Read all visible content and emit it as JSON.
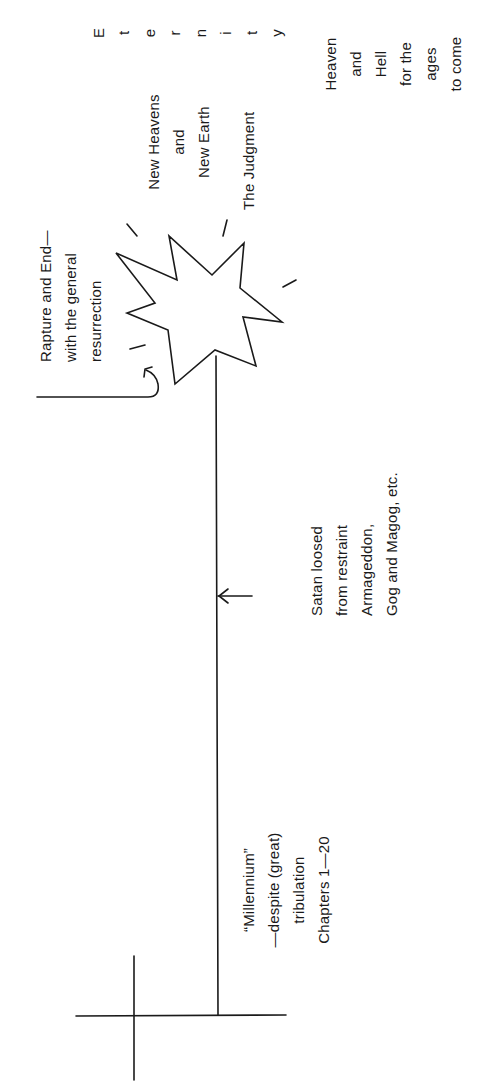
{
  "figure": {
    "orientation": "rotated -90 degrees",
    "stroke_color": "#1a1a1a",
    "background": "#ffffff"
  },
  "labels": {
    "rapture": [
      "Rapture and End—",
      "with the general",
      "resurrection"
    ],
    "new_heavens": [
      "New Heavens",
      "and",
      "New Earth"
    ],
    "judgment": [
      "The Judgment"
    ],
    "eternity": [
      "E",
      "t",
      "e",
      "r",
      "n",
      "i",
      "t",
      "y"
    ],
    "heaven_hell": [
      "Heaven",
      "and",
      "Hell",
      "for the",
      "ages",
      "to come"
    ],
    "satan": [
      "Satan loosed",
      "from restraint",
      "Armageddon,",
      "Gog and Magog, etc."
    ],
    "millennium": [
      "“Millennium”",
      "—despite (great)",
      "tribulation",
      "Chapters 1—20"
    ]
  },
  "shapes": {
    "timeline": "vertical-line",
    "event_marker": "starburst",
    "start_marker": "cross",
    "satan_marker": "arrow-left",
    "rapture_marker": "hook-arrow"
  }
}
